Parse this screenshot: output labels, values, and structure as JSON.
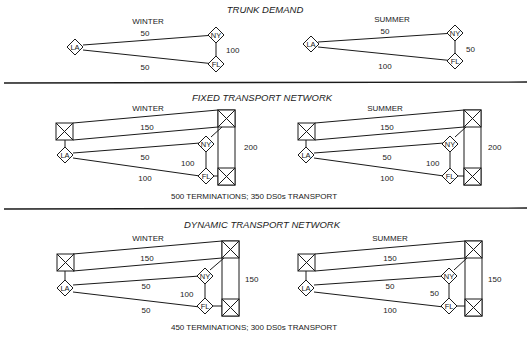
{
  "sections": {
    "trunk": {
      "title": "TRUNK DEMAND",
      "winter": {
        "label": "WINTER",
        "la_ny": "50",
        "la_fl": "50",
        "ny_fl": "100"
      },
      "summer": {
        "label": "SUMMER",
        "la_ny": "50",
        "la_fl": "100",
        "ny_fl": "50"
      }
    },
    "fixed": {
      "title": "FIXED TRANSPORT NETWORK",
      "winter": {
        "label": "WINTER",
        "transport": "150",
        "la_ny": "50",
        "la_fl": "100",
        "ny_fl": "100",
        "vertical": "200"
      },
      "summer": {
        "label": "SUMMER",
        "transport": "150",
        "la_ny": "50",
        "la_fl": "100",
        "ny_fl": "100",
        "vertical": "200"
      },
      "summary": "500 TERMINATIONS; 350 DS0s TRANSPORT"
    },
    "dynamic": {
      "title": "DYNAMIC TRANSPORT NETWORK",
      "winter": {
        "label": "WINTER",
        "transport": "150",
        "la_ny": "50",
        "la_fl": "50",
        "ny_fl": "100",
        "vertical": "150"
      },
      "summer": {
        "label": "SUMMER",
        "transport": "150",
        "la_ny": "50",
        "la_fl": "100",
        "ny_fl": "50",
        "vertical": "150"
      },
      "summary": "450 TERMINATIONS; 300 DS0s TRANSPORT"
    }
  },
  "nodes": {
    "la": "LA",
    "ny": "NY",
    "fl": "FL"
  }
}
